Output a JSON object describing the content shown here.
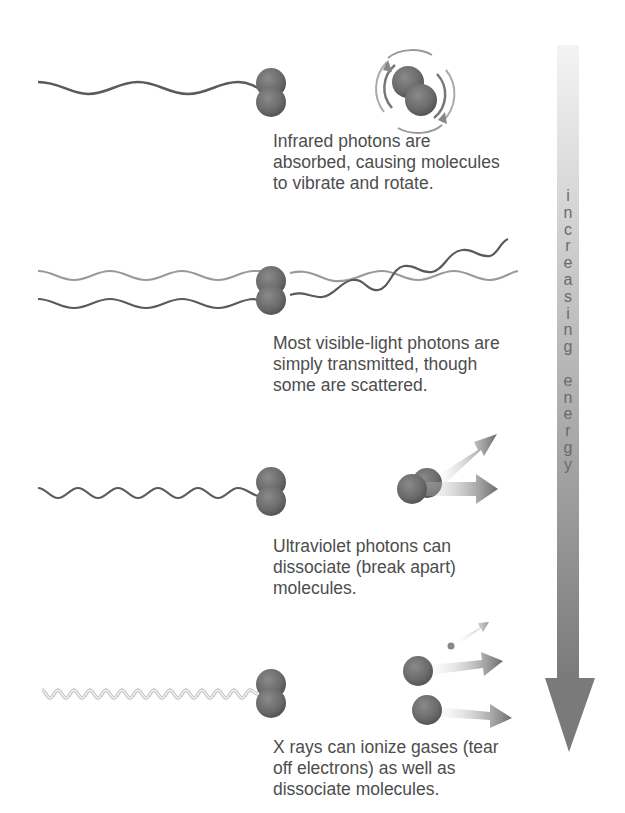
{
  "figure": {
    "panels": [
      {
        "id": "infrared",
        "wave": "long-wavelength wave",
        "caption_lines": [
          "Infrared photons are",
          "absorbed, causing molecules",
          "to vibrate and rotate."
        ]
      },
      {
        "id": "visible",
        "wave": "visible-light waves (transmitted and scattered)",
        "caption_lines": [
          "Most visible-light photons are",
          "simply transmitted, though",
          "some are scattered."
        ]
      },
      {
        "id": "ultraviolet",
        "wave": "short-wavelength wave",
        "caption_lines": [
          "Ultraviolet photons can",
          "dissociate (break apart)",
          "molecules."
        ]
      },
      {
        "id": "xray",
        "wave": "very short-wavelength wave",
        "caption_lines": [
          "X rays can ionize gases (tear",
          "off electrons) as well as",
          "dissociate molecules."
        ]
      }
    ],
    "energy_arrow": {
      "letters": [
        "i",
        "n",
        "c",
        "r",
        "e",
        "a",
        "s",
        "i",
        "n",
        "g",
        "",
        "e",
        "n",
        "e",
        "r",
        "g",
        "y"
      ],
      "label": "increasing energy",
      "color_top": "#f2f2f2",
      "color_bottom": "#7f7f7f"
    },
    "colors": {
      "molecule": "#6e6e6e",
      "wave_dark": "#5a5a5a",
      "wave_light": "#9a9a9a",
      "text": "#4d4d4d"
    }
  }
}
